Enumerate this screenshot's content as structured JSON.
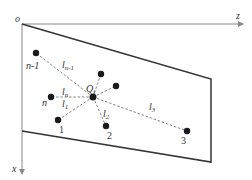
{
  "diagram": {
    "colors": {
      "line": "#333333",
      "axis": "#888888",
      "dash": "#777777",
      "point": "#1a1a1a",
      "background": "#ffffff"
    },
    "axes": {
      "origin_label": "o",
      "horizontal_label": "z",
      "vertical_label": "x"
    },
    "center": {
      "label": "Q",
      "subscript": "i"
    },
    "points": [
      {
        "id": "n-1",
        "label": "n-1"
      },
      {
        "id": "n",
        "label": "n"
      },
      {
        "id": "1",
        "label": "1"
      },
      {
        "id": "2",
        "label": "2"
      },
      {
        "id": "3",
        "label": "3"
      }
    ],
    "distances": [
      {
        "base": "l",
        "sub": "n-1"
      },
      {
        "base": "l",
        "sub": "n"
      },
      {
        "base": "l",
        "sub": "1"
      },
      {
        "base": "l",
        "sub": "2"
      },
      {
        "base": "l",
        "sub": "3"
      }
    ]
  }
}
